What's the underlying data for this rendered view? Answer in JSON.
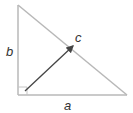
{
  "diagram": {
    "type": "right-triangle-vector",
    "labels": {
      "a": "a",
      "b": "b",
      "c": "c"
    },
    "colors": {
      "triangle_stroke": "#b8b8b8",
      "arrow_stroke": "#444444",
      "label": "#333333",
      "background": "#ffffff"
    },
    "geometry": {
      "right_angle_vertex": [
        18,
        95
      ],
      "top_vertex": [
        18,
        5
      ],
      "right_vertex": [
        127,
        95
      ],
      "arrow_start": [
        25,
        91
      ],
      "arrow_end": [
        73,
        46
      ]
    }
  }
}
